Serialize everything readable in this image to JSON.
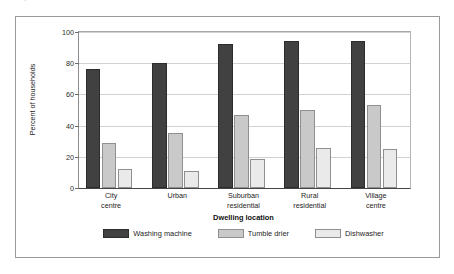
{
  "page": {
    "clipped_text_above_frame": "aiipii iiiai ii ai  i  aiiiii  ii iiiii i  i  i"
  },
  "chart_data": {
    "type": "bar",
    "title": "",
    "subtitle": "",
    "xlabel": "Dwelling location",
    "ylabel": "Percent of households",
    "categories": [
      "City\ncentre",
      "Urban",
      "Suburban\nresidential",
      "Rural\nresidential",
      "Village\ncentre"
    ],
    "category_lines": [
      [
        "City",
        "centre"
      ],
      [
        "Urban",
        ""
      ],
      [
        "Suburban",
        "residential"
      ],
      [
        "Rural",
        "residential"
      ],
      [
        "Village",
        "centre"
      ]
    ],
    "series": [
      {
        "name": "Washing machine",
        "color": "#414141",
        "values": [
          76,
          80,
          92,
          94.5,
          94
        ]
      },
      {
        "name": "Tumble drier",
        "color": "#c9c9c9",
        "values": [
          29,
          35,
          47,
          50,
          53
        ]
      },
      {
        "name": "Dishwasher",
        "color": "#eaeaea",
        "values": [
          12.5,
          11,
          18.5,
          25.5,
          25
        ]
      }
    ],
    "ylim": [
      0,
      100
    ],
    "yticks": [
      0,
      20,
      40,
      60,
      80,
      100
    ],
    "ytick_labels": [
      "0",
      "20",
      "40",
      "60",
      "80",
      "100"
    ],
    "grid": true,
    "grid_axis": "y",
    "legend_position": "bottom-center",
    "legend_entries": [
      "Washing machine",
      "Tumble drier",
      "Dishwasher"
    ]
  },
  "colors": {
    "washing_machine": "#414141",
    "tumble_drier": "#c9c9c9",
    "dishwasher": "#eaeaea",
    "gridline": "#d2d2d2",
    "axis": "#454545",
    "frame": "#9a9a9a",
    "background": "#ffffff"
  }
}
